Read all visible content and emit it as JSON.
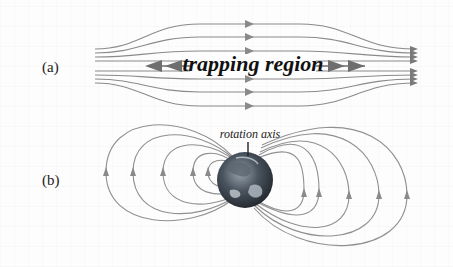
{
  "figure": {
    "panel_a": {
      "label": "(a)",
      "region_label": "trapping region",
      "field_line_count": 8,
      "colors": {
        "field_line": "#8a8a8a",
        "arrow": "#7a7a7a",
        "region_arrow": "#6e6e6e",
        "text": "#111111"
      }
    },
    "panel_b": {
      "label": "(b)",
      "axis_label": "rotation axis",
      "loops_per_side": 5,
      "colors": {
        "field_line": "#909090",
        "arrow": "#8a8a8a",
        "earth_dark": "#2b2f36",
        "earth_light": "#c9cfd6"
      }
    },
    "background": "#fdfdfd"
  }
}
